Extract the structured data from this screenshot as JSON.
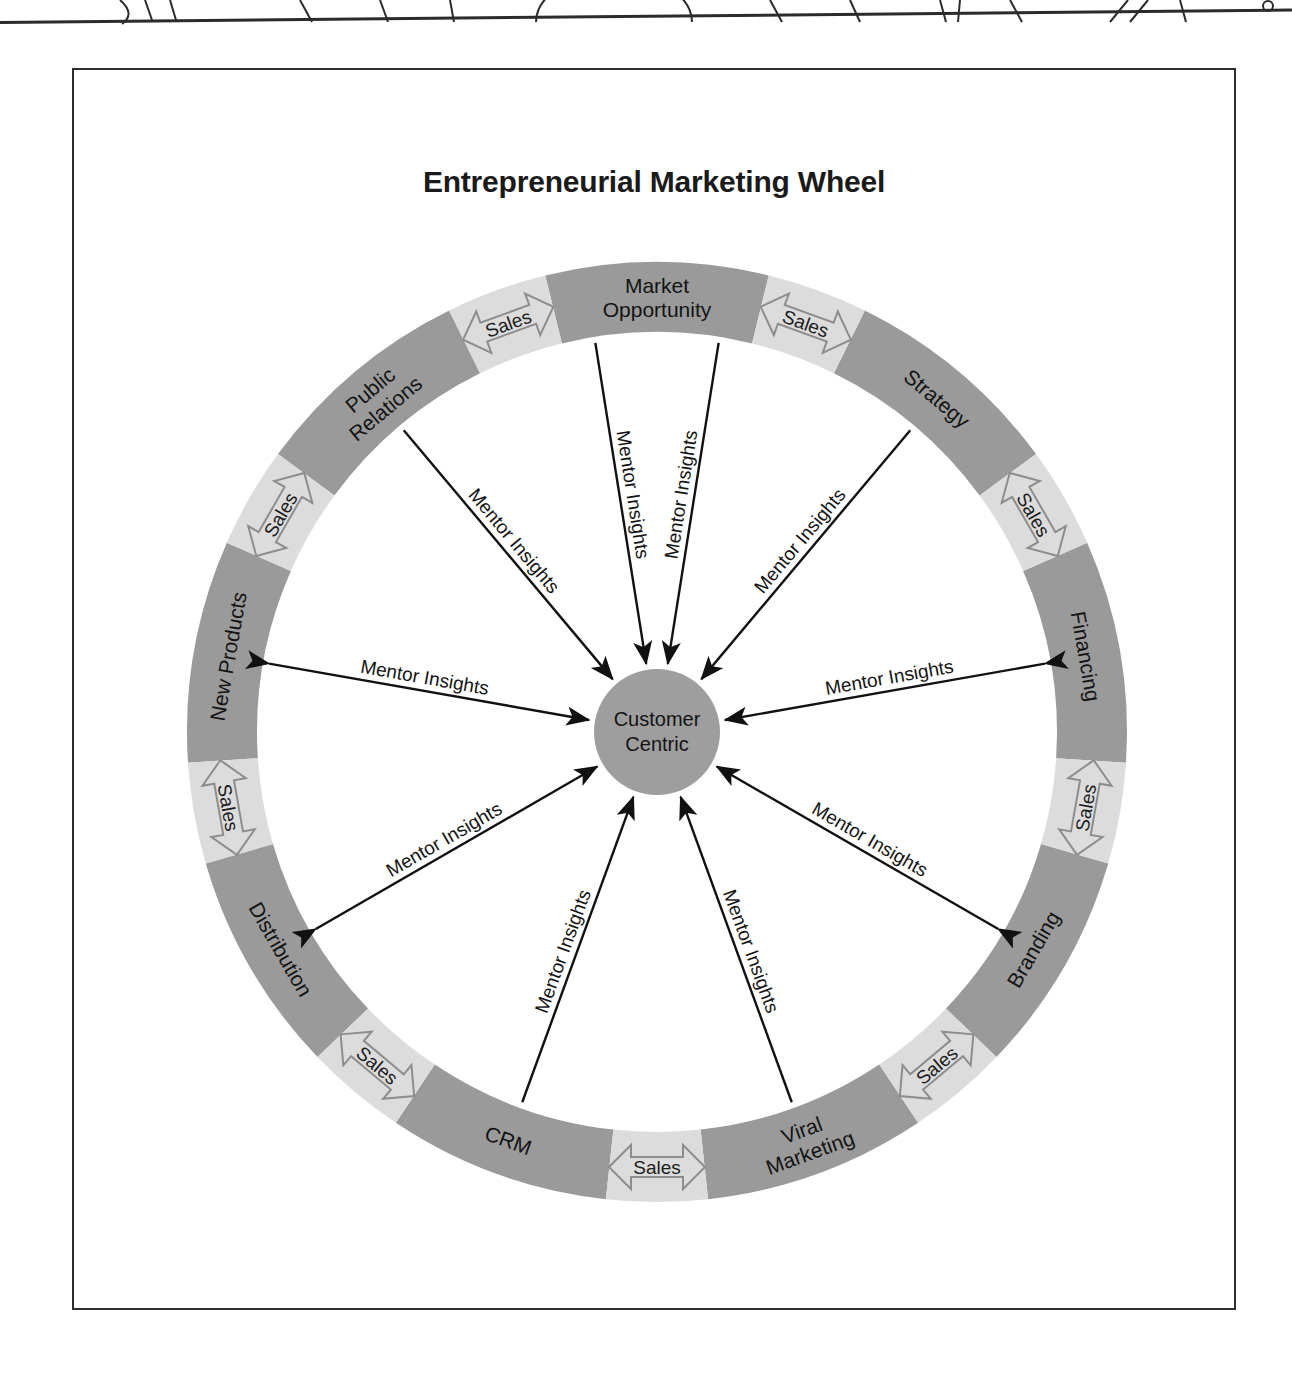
{
  "page": {
    "title": "Entrepreneurial Marketing Wheel"
  },
  "wheel": {
    "hub": {
      "line1": "Customer",
      "line2": "Centric"
    },
    "connector_label": "Sales",
    "spoke_label": "Mentor Insights",
    "segments": [
      {
        "id": "market-opportunity",
        "line1": "Market",
        "line2": "Opportunity",
        "angle_deg": 0
      },
      {
        "id": "strategy",
        "line1": "Strategy",
        "line2": "",
        "angle_deg": 45
      },
      {
        "id": "financing",
        "line1": "Financing",
        "line2": "",
        "angle_deg": 90
      },
      {
        "id": "branding",
        "line1": "Branding",
        "line2": "",
        "angle_deg": 135
      },
      {
        "id": "viral-marketing",
        "line1": "Viral",
        "line2": "Marketing",
        "angle_deg": 180
      },
      {
        "id": "crm",
        "line1": "CRM",
        "line2": "",
        "angle_deg": 225
      },
      {
        "id": "distribution",
        "line1": "Distribution",
        "line2": "",
        "angle_deg": 270
      },
      {
        "id": "new-products",
        "line1": "New Products",
        "line2": "",
        "angle_deg": 315
      },
      {
        "id": "public-relations",
        "line1": "Public",
        "line2": "Relations",
        "angle_deg": 337.5
      }
    ],
    "connectors": [
      {
        "id": "sales-1",
        "angle_deg": 22.5
      },
      {
        "id": "sales-2",
        "angle_deg": 67.5
      },
      {
        "id": "sales-3",
        "angle_deg": 112.5
      },
      {
        "id": "sales-4",
        "angle_deg": 157.5
      },
      {
        "id": "sales-5",
        "angle_deg": 202.5
      },
      {
        "id": "sales-6",
        "angle_deg": 247.5
      },
      {
        "id": "sales-7",
        "angle_deg": 292.5
      },
      {
        "id": "sales-8",
        "angle_deg": 337.5
      }
    ],
    "spokes": [
      {
        "id": "spoke-market-opportunity-left",
        "target": "Market Opportunity",
        "angle_deg": 281
      },
      {
        "id": "spoke-market-opportunity-right",
        "target": "Market Opportunity",
        "angle_deg": 259
      },
      {
        "id": "spoke-strategy",
        "target": "Strategy",
        "angle_deg": 315
      },
      {
        "id": "spoke-financing",
        "target": "Financing",
        "angle_deg": 2
      },
      {
        "id": "spoke-branding",
        "target": "Branding",
        "angle_deg": 42
      },
      {
        "id": "spoke-viral-marketing",
        "target": "Viral Marketing",
        "angle_deg": 73
      },
      {
        "id": "spoke-crm",
        "target": "CRM",
        "angle_deg": 107
      },
      {
        "id": "spoke-distribution",
        "target": "Distribution",
        "angle_deg": 138
      },
      {
        "id": "spoke-new-products",
        "target": "New Products",
        "angle_deg": 180
      },
      {
        "id": "spoke-public-relations",
        "target": "Public Relations",
        "angle_deg": 222
      }
    ]
  },
  "colors": {
    "segment_fill": "#9a9a9a",
    "connector_fill": "#dcdcdc",
    "hub_fill": "#9e9e9e",
    "frame_stroke": "#2e2e2e",
    "arrow_stroke": "#111111",
    "text": "#141414",
    "page_background": "#ffffff"
  }
}
